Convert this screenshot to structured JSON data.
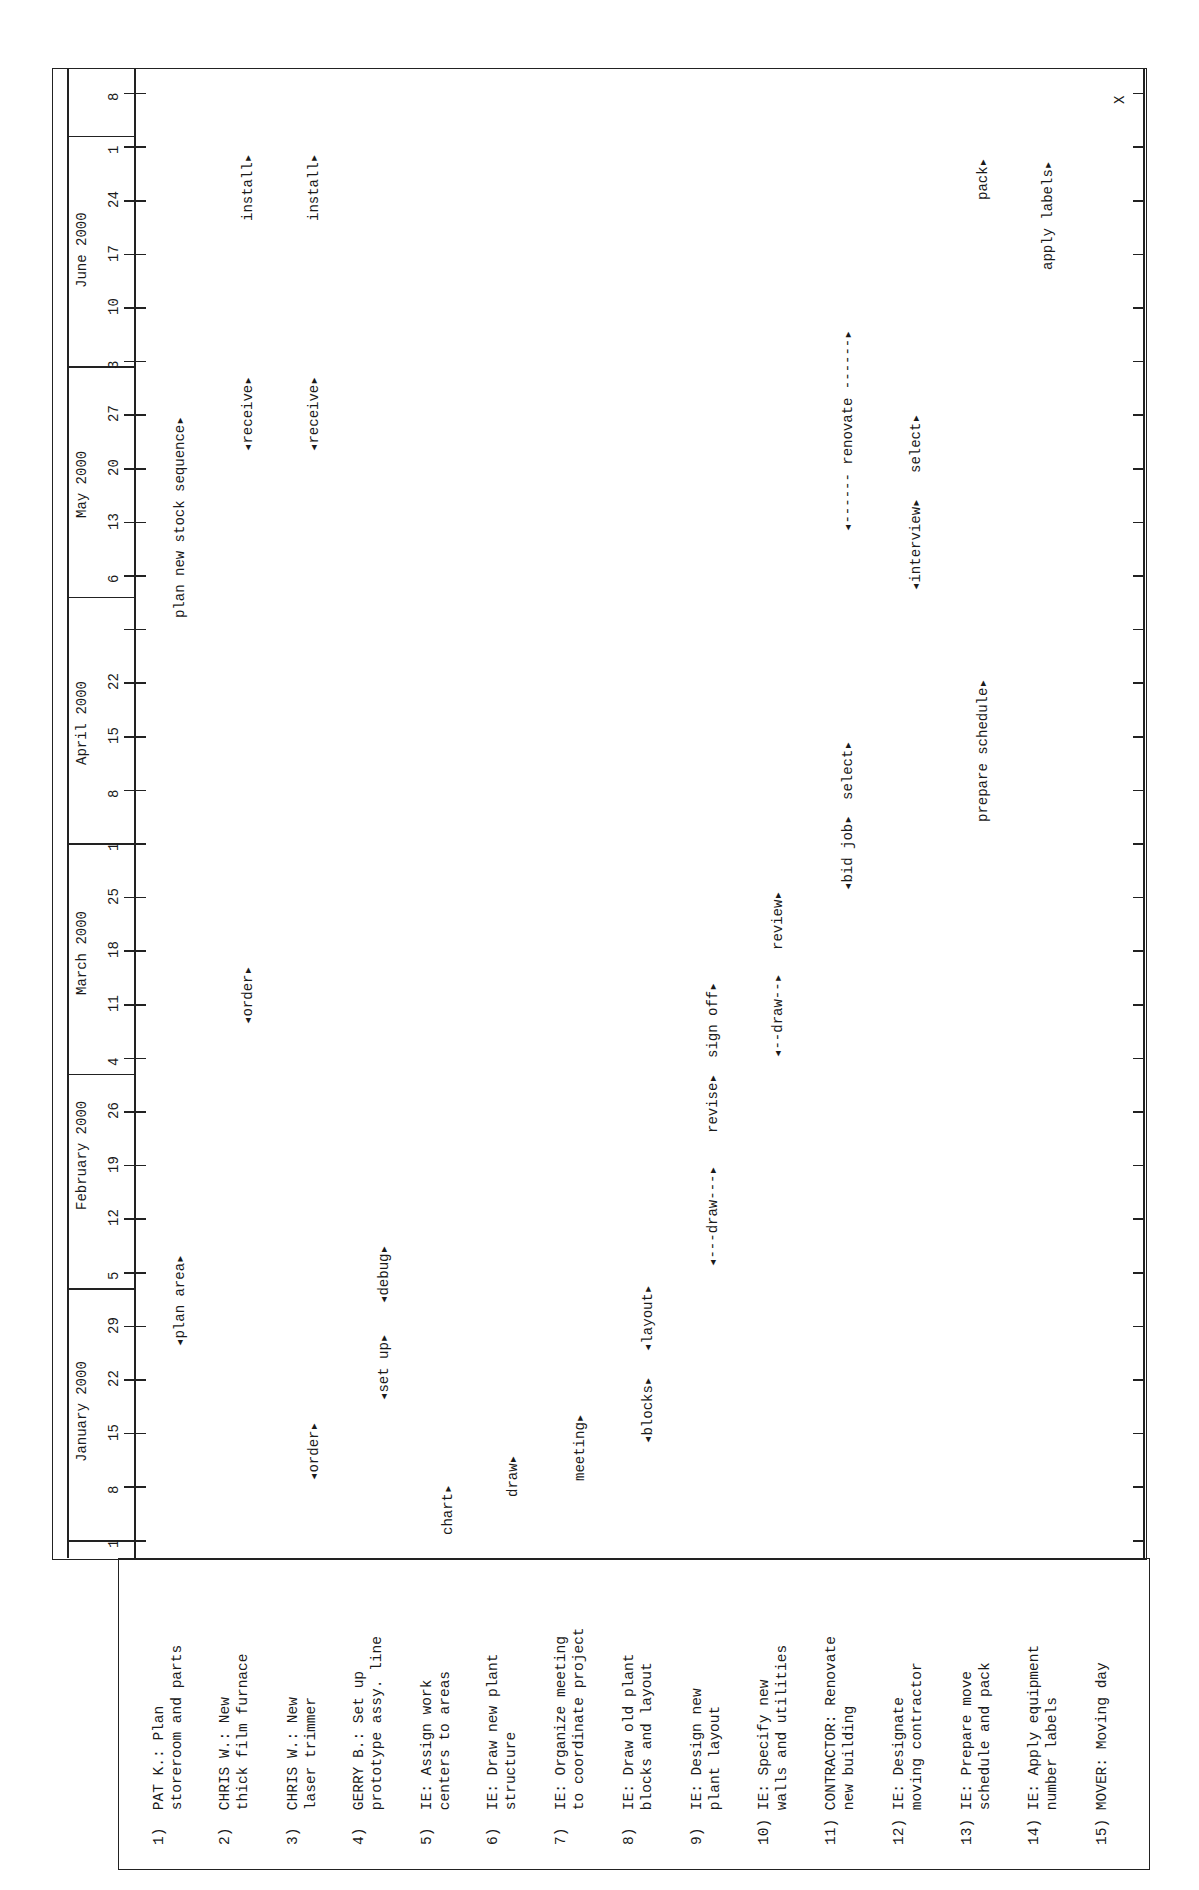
{
  "chart_data": {
    "type": "gantt",
    "title": "",
    "orientation": "page rotated 90° counter-clockwise",
    "months": [
      {
        "label": "January 2000",
        "week_ticks": [
          "1",
          "8",
          "15",
          "22",
          "29"
        ]
      },
      {
        "label": "February 2000",
        "week_ticks": [
          "5",
          "12",
          "19",
          "26"
        ]
      },
      {
        "label": "March 2000",
        "week_ticks": [
          "4",
          "11",
          "18",
          "25"
        ]
      },
      {
        "label": "April 2000",
        "week_ticks": [
          "1",
          "8",
          "15",
          "22",
          ""
        ]
      },
      {
        "label": "May 2000",
        "week_ticks": [
          "6",
          "13",
          "20",
          "27"
        ]
      },
      {
        "label": "June 2000",
        "week_ticks": [
          "3",
          "10",
          "17",
          "24"
        ]
      },
      {
        "label": "",
        "week_ticks": [
          "1",
          "8"
        ]
      }
    ],
    "tasks": [
      {
        "id": "1)",
        "line1": "PAT K.: Plan",
        "line2": "storeroom and parts",
        "bars": [
          {
            "text": "◂plan area▸",
            "start_week": 3.6,
            "end_week": 5.2
          },
          {
            "text": "plan new stock sequence▸",
            "start_week": 17.2,
            "end_week": 22.0
          }
        ]
      },
      {
        "id": "2)",
        "line1": "CHRIS W.: New",
        "line2": "thick film furnace",
        "bars": [
          {
            "text": "◂order▸",
            "start_week": 9.6,
            "end_week": 10.8
          },
          {
            "text": "◂receive▸",
            "start_week": 20.3,
            "end_week": 22.0
          },
          {
            "text": "install▸",
            "start_week": 24.6,
            "end_week": 26.0
          }
        ]
      },
      {
        "id": "3)",
        "line1": "CHRIS W.: New",
        "line2": "laser trimmer",
        "bars": [
          {
            "text": "◂order▸",
            "start_week": 1.1,
            "end_week": 2.3
          },
          {
            "text": "◂receive▸",
            "start_week": 20.3,
            "end_week": 22.0
          },
          {
            "text": "install▸",
            "start_week": 24.6,
            "end_week": 26.0
          }
        ]
      },
      {
        "id": "4)",
        "line1": "GERRY B.: Set up",
        "line2": "prototype assy. line",
        "bars": [
          {
            "text": "◂set up▸",
            "start_week": 2.6,
            "end_week": 4.1
          },
          {
            "text": "◂debug▸",
            "start_week": 4.4,
            "end_week": 5.7
          }
        ]
      },
      {
        "id": "5)",
        "line1": "IE: Assign work",
        "line2": "centers to areas",
        "bars": [
          {
            "text": "chart▸",
            "start_week": 0.1,
            "end_week": 1.1
          }
        ]
      },
      {
        "id": "6)",
        "line1": "IE: Draw new plant",
        "line2": "structure",
        "bars": [
          {
            "text": "draw▸",
            "start_week": 0.8,
            "end_week": 1.8
          }
        ]
      },
      {
        "id": "7)",
        "line1": "IE: Organize meeting",
        "line2": "to coordinate project",
        "bars": [
          {
            "text": "meeting▸",
            "start_week": 1.1,
            "end_week": 2.6
          }
        ]
      },
      {
        "id": "8)",
        "line1": "IE: Draw old plant",
        "line2": "blocks and layout",
        "bars": [
          {
            "text": "◂blocks▸",
            "start_week": 1.8,
            "end_week": 3.3
          },
          {
            "text": "◂layout▸",
            "start_week": 3.5,
            "end_week": 4.9
          }
        ]
      },
      {
        "id": "9)",
        "line1": "IE: Design new",
        "line2": "plant layout",
        "bars": [
          {
            "text": "◂---draw---▸",
            "start_week": 5.1,
            "end_week": 7.5
          },
          {
            "text": "revise▸",
            "start_week": 7.6,
            "end_week": 8.9
          },
          {
            "text": "sign off▸",
            "start_week": 9.0,
            "end_week": 10.6
          }
        ]
      },
      {
        "id": "10)",
        "line1": "IE: Specify new",
        "line2": "walls and utilities",
        "bars": [
          {
            "text": "◂--draw--▸",
            "start_week": 9.0,
            "end_week": 10.8
          },
          {
            "text": "review▸",
            "start_week": 11.0,
            "end_week": 12.4
          }
        ]
      },
      {
        "id": "11)",
        "line1": "CONTRACTOR: Renovate",
        "line2": "new building",
        "bars": [
          {
            "text": "◂bid job▸",
            "start_week": 12.1,
            "end_week": 13.6
          },
          {
            "text": "select▸",
            "start_week": 13.8,
            "end_week": 15.0
          },
          {
            "text": "◂------ renovate ------▸",
            "start_week": 18.8,
            "end_week": 24.0
          }
        ]
      },
      {
        "id": "12)",
        "line1": "IE: Designate",
        "line2": "moving contractor",
        "bars": [
          {
            "text": "◂interview▸",
            "start_week": 17.7,
            "end_week": 19.7
          },
          {
            "text": "select▸",
            "start_week": 19.9,
            "end_week": 21.2
          }
        ]
      },
      {
        "id": "13)",
        "line1": "IE: Prepare move",
        "line2": "schedule and pack",
        "bars": [
          {
            "text": "prepare schedule▸",
            "start_week": 13.4,
            "end_week": 16.8
          },
          {
            "text": "pack▸",
            "start_week": 25.0,
            "end_week": 26.1
          }
        ]
      },
      {
        "id": "14)",
        "line1": "IE: Apply equipment",
        "line2": "number labels",
        "bars": [
          {
            "text": "apply labels▸",
            "start_week": 23.7,
            "end_week": 26.5
          }
        ]
      },
      {
        "id": "15)",
        "line1": "MOVER: Moving day",
        "line2": "",
        "bars": [
          {
            "text": "X",
            "start_week": 26.8,
            "end_week": 27.0
          }
        ]
      }
    ]
  },
  "header": {
    "months": [
      "January 2000",
      "February 2000",
      "March 2000",
      "April 2000",
      "May 2000",
      "June 2000"
    ],
    "ticks": [
      "1",
      "8",
      "15",
      "22",
      "29",
      "5",
      "12",
      "19",
      "26",
      "4",
      "11",
      "18",
      "25",
      "1",
      "8",
      "15",
      "22",
      "",
      "6",
      "13",
      "20",
      "27",
      "3",
      "10",
      "17",
      "24",
      "1",
      "8"
    ]
  }
}
